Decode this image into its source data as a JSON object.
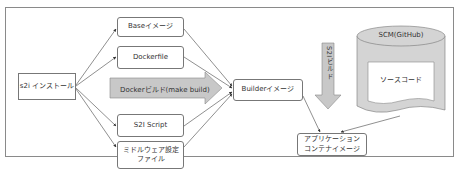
{
  "diagram": {
    "nodes": {
      "s2i_install": "s2i インストール",
      "base_image": "Baseイメージ",
      "dockerfile": "Dockerfile",
      "s2i_script": "S2I Script",
      "middleware_config": "ミドルウェア設定\nファイル",
      "builder_image": "Builderイメージ",
      "scm": "SCM(GitHub)",
      "source_code": "ソースコード",
      "app_image": "アプリケーション\nコンテナイメージ"
    },
    "arrows": {
      "docker_build": "Dockerビルド(make build)",
      "s2i_build": "S2Iビルド"
    },
    "colors": {
      "border": "#777777",
      "arrow_fill": "#c8c8c8",
      "cylinder_fill": "#d4d4d4",
      "line": "#444444"
    }
  }
}
